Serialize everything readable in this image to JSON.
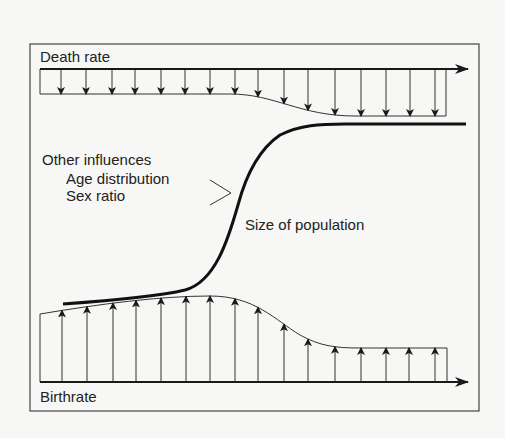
{
  "diagram": {
    "type": "population-dynamics",
    "labels": {
      "death_rate": "Death rate",
      "birthrate": "Birthrate",
      "other_influences": "Other influences",
      "age_distribution": "Age distribution",
      "sex_ratio": "Sex ratio",
      "population_size": "Size of population"
    },
    "colors": {
      "background": "#f7f7f5",
      "line": "#1a1a1a",
      "thin_line": "#333333",
      "text": "#222222"
    },
    "death_rate_arrows_x": [
      61,
      86,
      112,
      135,
      161,
      185,
      210,
      235,
      258,
      284,
      308,
      335,
      361,
      386,
      410,
      435
    ],
    "birth_rate_arrows_x": [
      62,
      87,
      113,
      136,
      161,
      186,
      210,
      235,
      258,
      284,
      308,
      335,
      361,
      386,
      409,
      435
    ]
  }
}
